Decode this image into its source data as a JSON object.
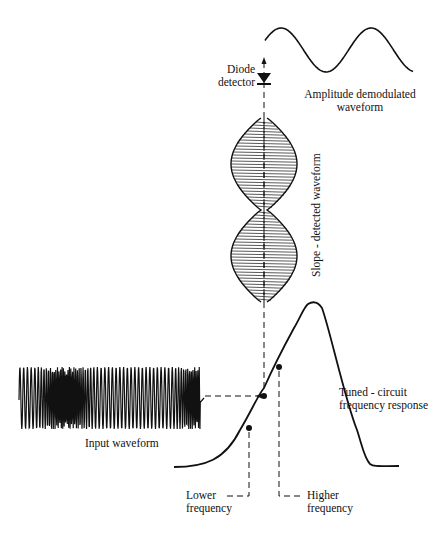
{
  "labels": {
    "diode_detector": [
      "Diode",
      "detector"
    ],
    "amplitude_demodulated": [
      "Amplitude  demodulated",
      "waveform"
    ],
    "slope_detected": "Slope - detected  waveform",
    "tuned_circuit": [
      "Tuned - circuit",
      "frequency  response"
    ],
    "input_waveform": "Input  waveform",
    "lower_frequency": [
      "Lower",
      "frequency"
    ],
    "higher_frequency": [
      "Higher",
      "frequency"
    ]
  },
  "colors": {
    "ink": "#111111",
    "background": "#ffffff"
  }
}
